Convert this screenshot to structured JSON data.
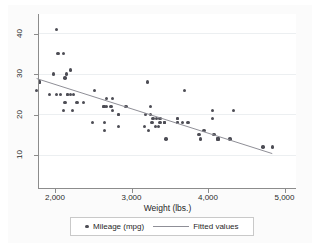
{
  "chart_data": {
    "type": "scatter",
    "title": "",
    "xlabel": "Weight (lbs.)",
    "ylabel": "",
    "xlim": [
      1760,
      4900
    ],
    "ylim": [
      9,
      43
    ],
    "grid": true,
    "legend_position": "bottom",
    "x_ticks": [
      {
        "value": 2000,
        "label": "2,000"
      },
      {
        "value": 3000,
        "label": "3,000"
      },
      {
        "value": 4000,
        "label": "4,000"
      },
      {
        "value": 5000,
        "label": "5,000"
      }
    ],
    "y_ticks": [
      {
        "value": 10,
        "label": "10"
      },
      {
        "value": 20,
        "label": "20"
      },
      {
        "value": 30,
        "label": "30"
      },
      {
        "value": 40,
        "label": "40"
      }
    ],
    "series": [
      {
        "name": "Mileage (mpg)",
        "type": "scatter",
        "marker": "circle",
        "color": "#4d4d55",
        "points": [
          [
            2930,
            22
          ],
          [
            3350,
            17
          ],
          [
            2640,
            22
          ],
          [
            3250,
            20
          ],
          [
            4080,
            15
          ],
          [
            3670,
            18
          ],
          [
            3690,
            26
          ],
          [
            3180,
            20
          ],
          [
            3220,
            16
          ],
          [
            4060,
            19
          ],
          [
            3600,
            19
          ],
          [
            3600,
            18
          ],
          [
            3740,
            18
          ],
          [
            4130,
            14
          ],
          [
            4130,
            14
          ],
          [
            2230,
            21
          ],
          [
            2130,
            29
          ],
          [
            2650,
            16
          ],
          [
            3880,
            15
          ],
          [
            4330,
            21
          ],
          [
            3900,
            14
          ],
          [
            4290,
            14
          ],
          [
            2110,
            35
          ],
          [
            2200,
            25
          ],
          [
            2020,
            41
          ],
          [
            2830,
            20
          ],
          [
            2200,
            31
          ],
          [
            2520,
            26
          ],
          [
            2490,
            18
          ],
          [
            2290,
            23
          ],
          [
            2040,
            35
          ],
          [
            1800,
            28
          ],
          [
            1800,
            28
          ],
          [
            2670,
            24
          ],
          [
            2750,
            24
          ],
          [
            3430,
            18
          ],
          [
            3210,
            28
          ],
          [
            3600,
            18
          ],
          [
            3330,
            19
          ],
          [
            3370,
            19
          ],
          [
            4130,
            14
          ],
          [
            3370,
            18
          ],
          [
            3270,
            18
          ],
          [
            2830,
            17
          ],
          [
            2650,
            18
          ],
          [
            1760,
            26
          ],
          [
            1980,
            30
          ],
          [
            2150,
            30
          ],
          [
            2670,
            22
          ],
          [
            2130,
            23
          ],
          [
            2750,
            21
          ],
          [
            3310,
            17
          ],
          [
            3450,
            14
          ],
          [
            2160,
            25
          ],
          [
            3250,
            22
          ],
          [
            4720,
            12
          ],
          [
            3950,
            16
          ],
          [
            4840,
            12
          ],
          [
            2110,
            21
          ],
          [
            2830,
            20
          ],
          [
            2070,
            25
          ],
          [
            1930,
            25
          ],
          [
            4060,
            21
          ],
          [
            3430,
            18
          ],
          [
            3600,
            19
          ],
          [
            2730,
            22
          ],
          [
            3280,
            19
          ],
          [
            3430,
            18
          ],
          [
            2640,
            22
          ],
          [
            2240,
            25
          ],
          [
            2370,
            23
          ],
          [
            3170,
            17
          ],
          [
            2020,
            25
          ],
          [
            2160,
            25
          ]
        ]
      },
      {
        "name": "Fitted values",
        "type": "line",
        "color": "#8f8f97",
        "equation": {
          "intercept": 39.44,
          "slope": -0.006009
        },
        "endpoints": [
          [
            1760,
            28.87
          ],
          [
            4840,
            10.35
          ]
        ]
      }
    ]
  },
  "axis": {
    "x_title": "Weight (lbs.)"
  },
  "legend": {
    "entries": [
      {
        "label": "Mileage (mpg)",
        "marker": "circle"
      },
      {
        "label": "Fitted values",
        "marker": "line"
      }
    ]
  }
}
